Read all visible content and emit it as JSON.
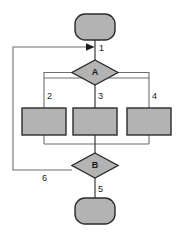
{
  "diagram": {
    "type": "flowchart",
    "title": "",
    "canvas": {
      "width": 184,
      "height": 238,
      "background": "#ffffff"
    },
    "colors": {
      "shape_fill": "#b3b3b3",
      "shape_stroke": "#2b2b2b",
      "connector": "#6e6e6e",
      "connector_dark": "#4a4a4a",
      "label_text": "#1a1a1a"
    },
    "nodes": [
      {
        "id": "start",
        "shape": "terminator",
        "label": ""
      },
      {
        "id": "decision_a",
        "shape": "diamond",
        "label": "A"
      },
      {
        "id": "process_left",
        "shape": "rectangle",
        "label": ""
      },
      {
        "id": "process_middle",
        "shape": "rectangle",
        "label": ""
      },
      {
        "id": "process_right",
        "shape": "rectangle",
        "label": ""
      },
      {
        "id": "decision_b",
        "shape": "diamond",
        "label": "B"
      },
      {
        "id": "end",
        "shape": "terminator",
        "label": ""
      }
    ],
    "edge_labels": {
      "e1": "1",
      "e2": "2",
      "e3": "3",
      "e4": "4",
      "e5": "5",
      "e6": "6"
    }
  }
}
